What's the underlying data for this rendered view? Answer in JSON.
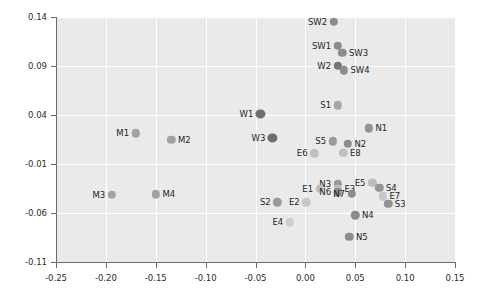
{
  "chart_data": {
    "type": "scatter",
    "title": "",
    "xlabel": "",
    "ylabel": "",
    "xlim": [
      -0.25,
      0.15
    ],
    "ylim": [
      -0.11,
      0.14
    ],
    "xticks": [
      -0.25,
      -0.2,
      -0.15,
      -0.1,
      -0.05,
      0.0,
      0.05,
      0.1,
      0.15
    ],
    "xticklabels": [
      "-0.25",
      "-0.20",
      "-0.15",
      "-0.10",
      "-0.05",
      "0.00",
      "0.05",
      "0.10",
      "0.15"
    ],
    "yticks": [
      -0.11,
      -0.06,
      -0.01,
      0.04,
      0.09,
      0.14
    ],
    "yticklabels": [
      "-0.11",
      "-0.06",
      "-0.01",
      "0.04",
      "0.09",
      "0.14"
    ],
    "grid": true,
    "legend": "none",
    "panel_color": "#eaeaea",
    "grid_color": "#ffffff",
    "points": [
      {
        "label": "SW2",
        "x": 0.0285,
        "y": 0.1352,
        "color": "#8c8c8c",
        "r": 4.2,
        "label_side": "left"
      },
      {
        "label": "SW1",
        "x": 0.0325,
        "y": 0.1105,
        "color": "#8c8c8c",
        "r": 4.2,
        "label_side": "left"
      },
      {
        "label": "SW3",
        "x": 0.037,
        "y": 0.1035,
        "color": "#8c8c8c",
        "r": 4.2,
        "label_side": "right"
      },
      {
        "label": "W2",
        "x": 0.0325,
        "y": 0.0905,
        "color": "#757575",
        "r": 4.2,
        "label_side": "left"
      },
      {
        "label": "SW4",
        "x": 0.0385,
        "y": 0.0855,
        "color": "#8c8c8c",
        "r": 4.2,
        "label_side": "right"
      },
      {
        "label": "S1",
        "x": 0.0325,
        "y": 0.05,
        "color": "#a8a8a8",
        "r": 4.2,
        "label_side": "left"
      },
      {
        "label": "W1",
        "x": -0.045,
        "y": 0.0415,
        "color": "#6e6e6e",
        "r": 4.6,
        "label_side": "left"
      },
      {
        "label": "N1",
        "x": 0.0635,
        "y": 0.0265,
        "color": "#939393",
        "r": 4.2,
        "label_side": "right"
      },
      {
        "label": "M1",
        "x": -0.17,
        "y": 0.0215,
        "color": "#a3a3a3",
        "r": 4.2,
        "label_side": "left"
      },
      {
        "label": "W3",
        "x": -0.033,
        "y": 0.0165,
        "color": "#6e6e6e",
        "r": 4.6,
        "label_side": "left"
      },
      {
        "label": "M2",
        "x": -0.1345,
        "y": 0.0145,
        "color": "#a3a3a3",
        "r": 4.2,
        "label_side": "right"
      },
      {
        "label": "S5",
        "x": 0.0275,
        "y": 0.013,
        "color": "#9a9a9a",
        "r": 4.2,
        "label_side": "left"
      },
      {
        "label": "N2",
        "x": 0.0425,
        "y": 0.0105,
        "color": "#8c8c8c",
        "r": 4.2,
        "label_side": "right"
      },
      {
        "label": "E6",
        "x": 0.009,
        "y": 0.001,
        "color": "#c0c0c0",
        "r": 4.2,
        "label_side": "left"
      },
      {
        "label": "E8",
        "x": 0.038,
        "y": 0.0015,
        "color": "#c0c0c0",
        "r": 4.2,
        "label_side": "right"
      },
      {
        "label": "E5",
        "x": 0.067,
        "y": -0.029,
        "color": "#bdbdbd",
        "r": 4.2,
        "label_side": "left"
      },
      {
        "label": "N3",
        "x": 0.0325,
        "y": -0.03,
        "color": "#9a9a9a",
        "r": 4.2,
        "label_side": "left"
      },
      {
        "label": "S4",
        "x": 0.074,
        "y": -0.034,
        "color": "#949494",
        "r": 4.2,
        "label_side": "right"
      },
      {
        "label": "E1",
        "x": 0.0145,
        "y": -0.0355,
        "color": "#bdbdbd",
        "r": 4.2,
        "label_side": "left"
      },
      {
        "label": "E3",
        "x": 0.0325,
        "y": -0.0355,
        "color": "#bdbdbd",
        "r": 4.2,
        "label_side": "right"
      },
      {
        "label": "M3",
        "x": -0.194,
        "y": -0.0415,
        "color": "#a3a3a3",
        "r": 4.2,
        "label_side": "left"
      },
      {
        "label": "M4",
        "x": -0.15,
        "y": -0.041,
        "color": "#a3a3a3",
        "r": 4.2,
        "label_side": "right"
      },
      {
        "label": "N6",
        "x": 0.0325,
        "y": -0.039,
        "color": "#8c8c8c",
        "r": 4.2,
        "label_side": "left"
      },
      {
        "label": "N7",
        "x": 0.0465,
        "y": -0.0405,
        "color": "#8c8c8c",
        "r": 4.2,
        "label_side": "left"
      },
      {
        "label": "E7",
        "x": 0.0775,
        "y": -0.043,
        "color": "#c7c7c7",
        "r": 4.2,
        "label_side": "right"
      },
      {
        "label": "S2",
        "x": -0.028,
        "y": -0.049,
        "color": "#999999",
        "r": 4.2,
        "label_side": "left"
      },
      {
        "label": "E2",
        "x": 0.001,
        "y": -0.049,
        "color": "#c7c7c7",
        "r": 4.2,
        "label_side": "left"
      },
      {
        "label": "S3",
        "x": 0.083,
        "y": -0.0505,
        "color": "#949494",
        "r": 4.2,
        "label_side": "right"
      },
      {
        "label": "N4",
        "x": 0.05,
        "y": -0.0625,
        "color": "#8c8c8c",
        "r": 4.2,
        "label_side": "right"
      },
      {
        "label": "E4",
        "x": -0.0155,
        "y": -0.0695,
        "color": "#cdcdcd",
        "r": 4.2,
        "label_side": "left"
      },
      {
        "label": "N5",
        "x": 0.044,
        "y": -0.084,
        "color": "#8c8c8c",
        "r": 4.2,
        "label_side": "right"
      }
    ]
  }
}
